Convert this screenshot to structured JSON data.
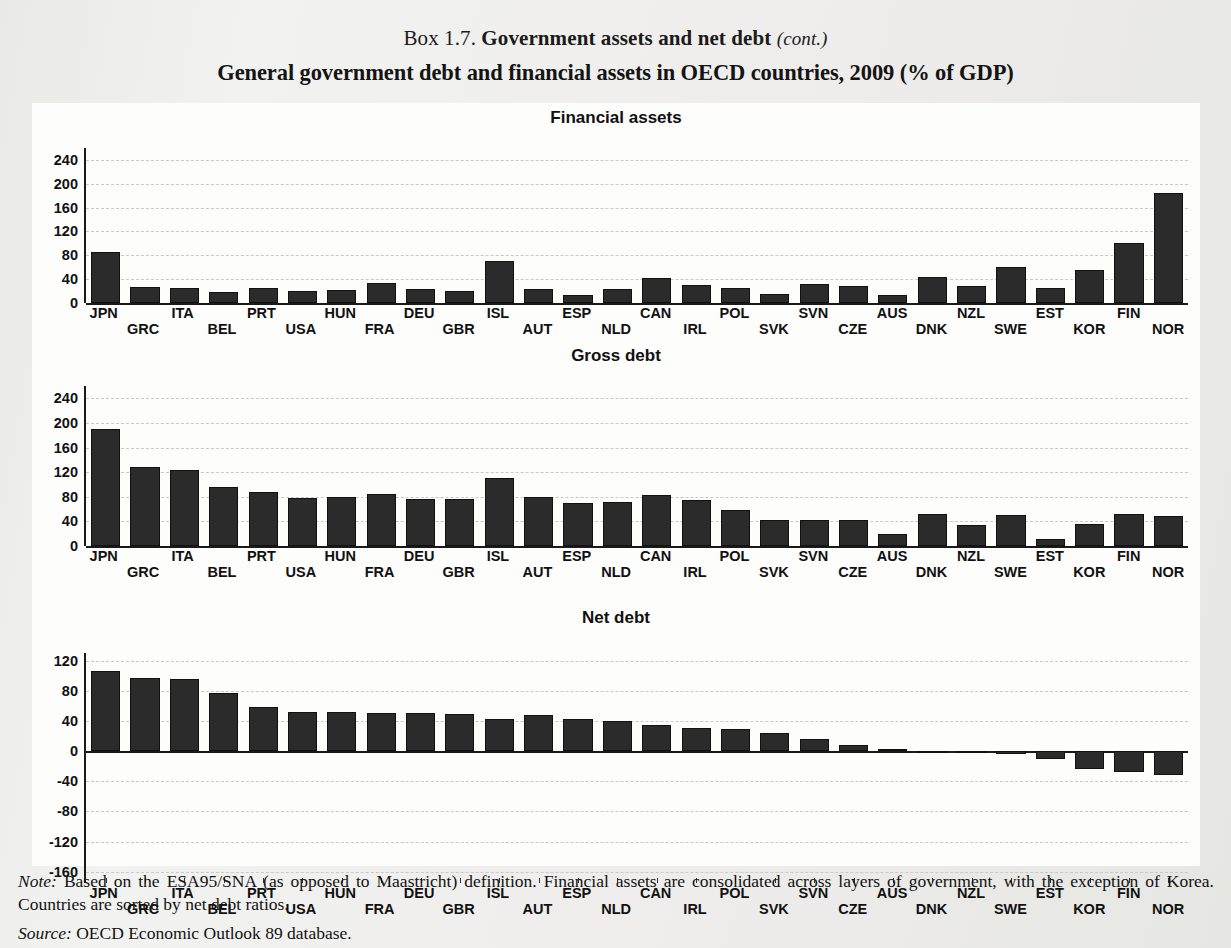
{
  "box_label": "Box 1.7.",
  "box_title": "Government assets and net debt",
  "box_cont": "(cont.)",
  "main_title": "General government debt and financial assets in OECD countries, 2009 (% of GDP)",
  "footer": {
    "note_label": "Note:",
    "note_text": " Based on the ESA95/SNA (as opposed to Maastricht) definition. Financial assets are consolidated across layers of government, with the exception of Korea. Countries are sorted by net debt ratios.",
    "source_label": "Source:",
    "source_text": " OECD Economic Outlook 89 database."
  },
  "chart_data": [
    {
      "type": "bar",
      "title": "Financial assets",
      "xlabel": "",
      "ylabel": "",
      "ylim": [
        0,
        260
      ],
      "yticks": [
        0,
        40,
        80,
        120,
        160,
        200,
        240
      ],
      "ytick_labels": [
        "0",
        "40",
        "80",
        "120",
        "160",
        "200",
        "240"
      ],
      "grid": true,
      "categories": [
        "JPN",
        "GRC",
        "ITA",
        "BEL",
        "PRT",
        "USA",
        "HUN",
        "FRA",
        "DEU",
        "GBR",
        "ISL",
        "AUT",
        "ESP",
        "NLD",
        "CAN",
        "IRL",
        "POL",
        "SVK",
        "SVN",
        "CZE",
        "AUS",
        "DNK",
        "NZL",
        "SWE",
        "EST",
        "KOR",
        "FIN",
        "NOR"
      ],
      "values": [
        86,
        27,
        26,
        18,
        25,
        20,
        22,
        33,
        24,
        20,
        70,
        24,
        14,
        23,
        42,
        30,
        26,
        15,
        32,
        28,
        13,
        44,
        28,
        60,
        25,
        55,
        100,
        185
      ]
    },
    {
      "type": "bar",
      "title": "Gross debt",
      "xlabel": "",
      "ylabel": "",
      "ylim": [
        0,
        260
      ],
      "yticks": [
        0,
        40,
        80,
        120,
        160,
        200,
        240
      ],
      "ytick_labels": [
        "0",
        "40",
        "80",
        "120",
        "160",
        "200",
        "240"
      ],
      "grid": true,
      "categories": [
        "JPN",
        "GRC",
        "ITA",
        "BEL",
        "PRT",
        "USA",
        "HUN",
        "FRA",
        "DEU",
        "GBR",
        "ISL",
        "AUT",
        "ESP",
        "NLD",
        "CAN",
        "IRL",
        "POL",
        "SVK",
        "SVN",
        "CZE",
        "AUS",
        "DNK",
        "NZL",
        "SWE",
        "EST",
        "KOR",
        "FIN",
        "NOR"
      ],
      "values": [
        190,
        129,
        123,
        96,
        88,
        78,
        79,
        85,
        77,
        76,
        110,
        79,
        70,
        72,
        83,
        75,
        59,
        43,
        43,
        42,
        19,
        52,
        34,
        51,
        12,
        35,
        52,
        49
      ]
    },
    {
      "type": "bar",
      "title": "Net debt",
      "xlabel": "",
      "ylabel": "",
      "ylim": [
        -175,
        130
      ],
      "yticks": [
        -160,
        -120,
        -80,
        -40,
        0,
        40,
        80,
        120
      ],
      "ytick_labels": [
        "-160",
        "-120",
        "-80",
        "-40",
        "0",
        "40",
        "80",
        "120"
      ],
      "grid": true,
      "categories": [
        "JPN",
        "GRC",
        "ITA",
        "BEL",
        "PRT",
        "USA",
        "HUN",
        "FRA",
        "DEU",
        "GBR",
        "ISL",
        "AUT",
        "ESP",
        "NLD",
        "CAN",
        "IRL",
        "POL",
        "SVK",
        "SVN",
        "CZE",
        "AUS",
        "DNK",
        "NZL",
        "SWE",
        "EST",
        "KOR",
        "FIN",
        "NOR"
      ],
      "values": [
        106,
        97,
        96,
        77,
        58,
        52,
        52,
        51,
        50,
        49,
        42,
        48,
        42,
        40,
        34,
        31,
        29,
        24,
        16,
        8,
        3,
        -2,
        -3,
        -4,
        -10,
        -24,
        -28,
        -32,
        -40,
        -52,
        -77,
        -160
      ]
    }
  ]
}
